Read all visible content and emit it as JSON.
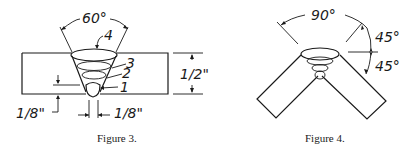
{
  "figure3": {
    "caption": "Figure 3.",
    "angle_label": "60°",
    "pass_labels": [
      "4",
      "3",
      "2",
      "1"
    ],
    "thickness_label": "1/2\"",
    "root_face_label": "1/8\"",
    "root_gap_label": "1/8\""
  },
  "figure4": {
    "caption": "Figure 4.",
    "angle_total_label": "90°",
    "angle_upper_label": "45°",
    "angle_lower_label": "45°"
  },
  "colors": {
    "ink": "#1a1a1a",
    "background": "#ffffff"
  }
}
